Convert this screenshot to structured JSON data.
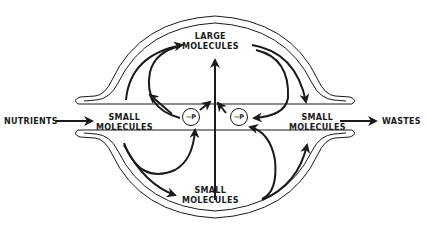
{
  "diagram": {
    "type": "metabolic-flow",
    "title": "",
    "colors": {
      "ink": "#1a1a1a",
      "background": "#ffffff"
    },
    "nodes": [
      {
        "id": "nutrients",
        "label": "NUTRIENTS"
      },
      {
        "id": "small_left",
        "line1": "SMALL",
        "line2": "MOLECULES"
      },
      {
        "id": "large_top",
        "line1": "LARGE",
        "line2": "MOLECULES"
      },
      {
        "id": "small_right",
        "line1": "SMALL",
        "line2": "MOLECULES"
      },
      {
        "id": "small_bottom",
        "line1": "SMALL",
        "line2": "MOLECULES"
      },
      {
        "id": "wastes",
        "label": "WASTES"
      },
      {
        "id": "atp_left",
        "label": "~P"
      },
      {
        "id": "atp_right",
        "label": "~P"
      }
    ],
    "edges": [
      {
        "from": "nutrients",
        "to": "small_left"
      },
      {
        "from": "small_left",
        "to": "large_top"
      },
      {
        "from": "small_left",
        "to": "small_bottom"
      },
      {
        "from": "small_left",
        "to": "atp_left"
      },
      {
        "from": "atp_left",
        "to": "large_top"
      },
      {
        "from": "atp_left",
        "to": "center_stem"
      },
      {
        "from": "small_bottom",
        "to": "large_top"
      },
      {
        "from": "small_bottom",
        "to": "atp_right"
      },
      {
        "from": "small_bottom",
        "to": "small_right"
      },
      {
        "from": "large_top",
        "to": "small_right"
      },
      {
        "from": "large_top",
        "to": "atp_right"
      },
      {
        "from": "atp_right",
        "to": "center_stem"
      },
      {
        "from": "small_right",
        "to": "wastes"
      }
    ],
    "membrane": "double-line cell boundary with inlet (left) and outlet (right)"
  }
}
